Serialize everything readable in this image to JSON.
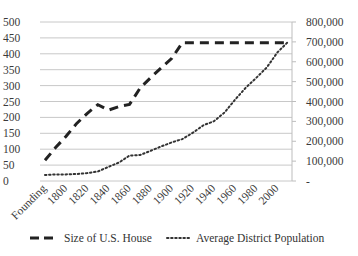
{
  "chart_data": {
    "type": "line",
    "title": "",
    "xlabel": "",
    "ylabel": "",
    "ylabel_right": "",
    "categories": [
      "Founding",
      "1790",
      "1800",
      "1810",
      "1820",
      "1830",
      "1840",
      "1850",
      "1860",
      "1870",
      "1880",
      "1890",
      "1900",
      "1910",
      "1920",
      "1930",
      "1940",
      "1950",
      "1960",
      "1970",
      "1980",
      "1990",
      "2000",
      "2010"
    ],
    "tick_labels_shown": [
      "Founding",
      "1800",
      "1820",
      "1840",
      "1860",
      "1880",
      "1900",
      "1920",
      "1940",
      "1960",
      "1980",
      "2000"
    ],
    "series": [
      {
        "name": "Size of U.S. House",
        "axis": "left",
        "style": "dashed",
        "values": [
          65,
          105,
          141,
          181,
          213,
          240,
          223,
          234,
          241,
          292,
          325,
          356,
          386,
          435,
          435,
          435,
          435,
          435,
          435,
          435,
          435,
          435,
          435,
          435
        ]
      },
      {
        "name": "Average District Population",
        "axis": "right",
        "style": "dotted",
        "values": [
          30000,
          33000,
          33000,
          35000,
          40000,
          48000,
          71000,
          93000,
          128000,
          131000,
          152000,
          174000,
          194000,
          211000,
          243000,
          281000,
          301000,
          345000,
          410000,
          469000,
          519000,
          572000,
          647000,
          700000
        ]
      }
    ],
    "ylim": [
      0,
      500
    ],
    "yticks": [
      0,
      50,
      100,
      150,
      200,
      250,
      300,
      350,
      400,
      450,
      500
    ],
    "ylim_right": [
      0,
      800000
    ],
    "yticks_right": [
      "-",
      "100,000",
      "200,000",
      "300,000",
      "400,000",
      "500,000",
      "600,000",
      "700,000",
      "800,000"
    ],
    "grid": true,
    "legend_position": "bottom"
  },
  "legend": {
    "items": [
      {
        "label": "Size of U.S. House"
      },
      {
        "label": "Average District Population"
      }
    ]
  }
}
